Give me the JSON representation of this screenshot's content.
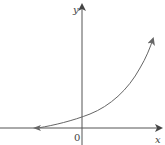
{
  "diagram": {
    "type": "function-graph",
    "axes": {
      "x_label": "x",
      "y_label": "y",
      "origin_label": "0"
    },
    "curve": {
      "shape": "exponential-increasing",
      "asymptote": "x-axis (y=0) to the left",
      "y_intercept": "positive, just above origin",
      "color": "#666666"
    },
    "colors": {
      "axis": "#555555",
      "curve": "#666666",
      "background": "#ffffff"
    }
  }
}
